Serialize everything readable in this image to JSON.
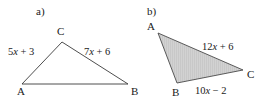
{
  "figure": {
    "background_color": "#ffffff",
    "stroke_color": "#3a3a3a",
    "fill_color": "#cfcfcf",
    "text_color": "#1a1a1a"
  },
  "parts": [
    {
      "key": "a",
      "part_label": "a)",
      "filled": false,
      "vertices": [
        {
          "name": "A",
          "label": "A",
          "x": 22,
          "y": 84
        },
        {
          "name": "C",
          "label": "C",
          "x": 62,
          "y": 42
        },
        {
          "name": "B",
          "label": "B",
          "x": 128,
          "y": 84
        }
      ],
      "side_labels": [
        {
          "key": "ac",
          "prefix": "5",
          "variable": "x",
          "suffix": " + 3",
          "text": "5x + 3"
        },
        {
          "key": "cb",
          "prefix": "7",
          "variable": "x",
          "suffix": " + 6",
          "text": "7x + 6"
        }
      ]
    },
    {
      "key": "b",
      "part_label": "b)",
      "filled": true,
      "vertices": [
        {
          "name": "A",
          "label": "A",
          "x": 158,
          "y": 33
        },
        {
          "name": "B",
          "label": "B",
          "x": 177,
          "y": 83
        },
        {
          "name": "C",
          "label": "C",
          "x": 243,
          "y": 70
        }
      ],
      "side_labels": [
        {
          "key": "ac",
          "prefix": "12",
          "variable": "x",
          "suffix": " + 6",
          "text": "12x + 6"
        },
        {
          "key": "bc",
          "prefix": "10",
          "variable": "x",
          "suffix": " − 2",
          "text": "10x − 2"
        }
      ]
    }
  ]
}
